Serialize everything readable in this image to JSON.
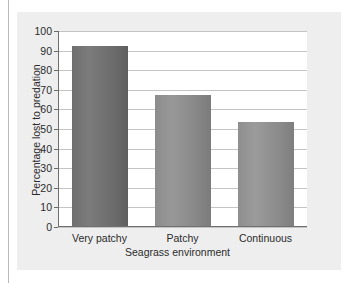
{
  "chart_data": {
    "type": "bar",
    "title": "",
    "xlabel": "Seagrass environment",
    "ylabel": "Percentage lost to predation",
    "categories": [
      "Very patchy",
      "Patchy",
      "Continuous"
    ],
    "values": [
      92,
      67,
      53
    ],
    "ylim": [
      0,
      100
    ],
    "yticks": [
      0,
      10,
      20,
      30,
      40,
      50,
      60,
      70,
      80,
      90,
      100
    ],
    "ytick_labels": [
      "0",
      "10",
      "20",
      "30",
      "40",
      "50",
      "60",
      "70",
      "80",
      "90",
      "100"
    ],
    "grid": true,
    "legend": false,
    "colors": {
      "bar_very_patchy": "#6f6f6f",
      "bar_patchy": "#8c8c8c",
      "bar_continuous": "#8f8f8f",
      "panel_background": "#eeeeee",
      "plot_background": "#ffffff",
      "gridline": "#c4c4c4",
      "axis": "#6f6f6f",
      "text": "#2b2b2b"
    }
  }
}
